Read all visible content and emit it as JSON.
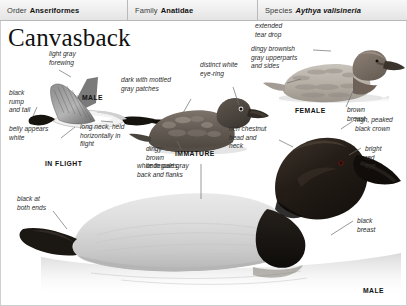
{
  "taxonomy": {
    "order_key": "Order",
    "order_value": "Anseriformes",
    "family_key": "Family",
    "family_value": "Anatidae",
    "species_key": "Species",
    "species_value": "Aythya valisineria"
  },
  "page": {
    "title": "Canvasback",
    "background_color": "#ffffff",
    "header_color": "#ededed",
    "border_color": "#cfcfcf",
    "text_color": "#2b2b2b"
  },
  "figures": {
    "in_flight": {
      "caption": "IN FLIGHT",
      "sex_caption": "MALE",
      "labels": {
        "forewing": "light gray\nforewing",
        "rump": "black\nrump\nand tail",
        "belly": "belly appears\nwhite",
        "neck": "long neck, held\nhorizontally in\nflight"
      }
    },
    "immature": {
      "caption": "IMMATURE",
      "labels": {
        "back": "dark with mottled\ngray patches",
        "eye_ring": "distinct white\neye-ring",
        "underparts": "dingy\nbrown\nunderparts"
      }
    },
    "female": {
      "caption": "FEMALE",
      "labels": {
        "upperparts": "dingy brownish\ngray upperparts\nand sides",
        "tear_drop": "extended\ntear drop",
        "breast": "brown\nbreast"
      }
    },
    "male_swimming": {
      "caption": "MALE",
      "labels": {
        "back": "white to pale gray\nback and flanks",
        "tail": "black at\nboth ends",
        "head_neck": "rich chestnut\nhead and\nneck",
        "crown": "high, peaked\nblack crown",
        "eye": "bright\nred\neye",
        "breast": "black\nbreast"
      }
    }
  }
}
